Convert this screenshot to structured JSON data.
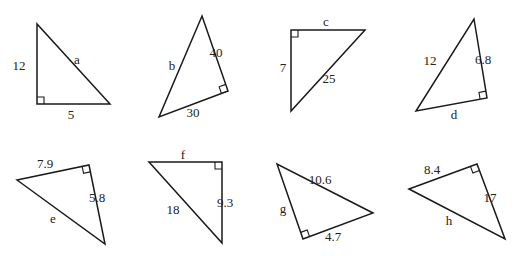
{
  "diagram": {
    "type": "right-triangle-set",
    "triangles": [
      {
        "id": "a",
        "unknown": "a",
        "known": [
          {
            "side": "leg",
            "value": "12"
          },
          {
            "side": "leg",
            "value": "5"
          }
        ],
        "unknown_side": "hypotenuse",
        "pts": [
          [
            37,
            24
          ],
          [
            37,
            104
          ],
          [
            110,
            104
          ]
        ],
        "right_angle": 1,
        "labels": [
          {
            "text": "12",
            "x": 19,
            "y": 70
          },
          {
            "text": "a",
            "x": 77,
            "y": 64
          },
          {
            "text": "5",
            "x": 71,
            "y": 119
          }
        ]
      },
      {
        "id": "b",
        "unknown": "b",
        "known": [
          {
            "side": "leg",
            "value": "40"
          },
          {
            "side": "leg",
            "value": "30"
          }
        ],
        "unknown_side": "hypotenuse",
        "pts": [
          [
            202,
            16
          ],
          [
            228,
            91
          ],
          [
            159,
            117
          ]
        ],
        "right_angle": 1,
        "labels": [
          {
            "text": "b",
            "x": 172,
            "y": 70
          },
          {
            "text": "40",
            "x": 216,
            "y": 57
          },
          {
            "text": "30",
            "x": 193,
            "y": 117
          }
        ]
      },
      {
        "id": "c",
        "unknown": "c",
        "known": [
          {
            "side": "leg",
            "value": "7"
          },
          {
            "side": "hypotenuse",
            "value": "25"
          }
        ],
        "unknown_side": "leg",
        "pts": [
          [
            365,
            30
          ],
          [
            291,
            30
          ],
          [
            291,
            111
          ]
        ],
        "right_angle": 1,
        "labels": [
          {
            "text": "c",
            "x": 326,
            "y": 26
          },
          {
            "text": "7",
            "x": 283,
            "y": 72
          },
          {
            "text": "25",
            "x": 329,
            "y": 83
          }
        ]
      },
      {
        "id": "d",
        "unknown": "d",
        "known": [
          {
            "side": "hypotenuse",
            "value": "12"
          },
          {
            "side": "leg",
            "value": "6.8"
          }
        ],
        "unknown_side": "leg",
        "pts": [
          [
            474,
            19
          ],
          [
            487,
            98
          ],
          [
            416,
            111
          ]
        ],
        "right_angle": 1,
        "labels": [
          {
            "text": "12",
            "x": 430,
            "y": 65
          },
          {
            "text": "6.8",
            "x": 483,
            "y": 64
          },
          {
            "text": "d",
            "x": 454,
            "y": 119
          }
        ]
      },
      {
        "id": "e",
        "unknown": "e",
        "known": [
          {
            "side": "leg",
            "value": "7.9"
          },
          {
            "side": "leg",
            "value": "5.8"
          }
        ],
        "unknown_side": "hypotenuse",
        "pts": [
          [
            17,
            180
          ],
          [
            89,
            165
          ],
          [
            105,
            244
          ]
        ],
        "right_angle": 1,
        "labels": [
          {
            "text": "7.9",
            "x": 45,
            "y": 168
          },
          {
            "text": "5.8",
            "x": 97,
            "y": 202
          },
          {
            "text": "e",
            "x": 53,
            "y": 223
          }
        ]
      },
      {
        "id": "f",
        "unknown": "f",
        "known": [
          {
            "side": "hypotenuse",
            "value": "18"
          },
          {
            "side": "leg",
            "value": "9.3"
          }
        ],
        "unknown_side": "leg",
        "pts": [
          [
            149,
            162
          ],
          [
            222,
            162
          ],
          [
            222,
            243
          ]
        ],
        "right_angle": 1,
        "labels": [
          {
            "text": "f",
            "x": 183,
            "y": 159
          },
          {
            "text": "18",
            "x": 173,
            "y": 214
          },
          {
            "text": "9.3",
            "x": 225,
            "y": 207
          }
        ]
      },
      {
        "id": "g",
        "unknown": "g",
        "known": [
          {
            "side": "hypotenuse",
            "value": "10.6"
          },
          {
            "side": "leg",
            "value": "4.7"
          }
        ],
        "unknown_side": "leg",
        "pts": [
          [
            277,
            164
          ],
          [
            303,
            239
          ],
          [
            373,
            213
          ]
        ],
        "right_angle": 1,
        "labels": [
          {
            "text": "10.6",
            "x": 320,
            "y": 184
          },
          {
            "text": "g",
            "x": 283,
            "y": 213
          },
          {
            "text": "4.7",
            "x": 333,
            "y": 241
          }
        ]
      },
      {
        "id": "h",
        "unknown": "h",
        "known": [
          {
            "side": "leg",
            "value": "8.4"
          },
          {
            "side": "leg",
            "value": "17"
          }
        ],
        "unknown_side": "hypotenuse",
        "pts": [
          [
            409,
            189
          ],
          [
            477,
            164
          ],
          [
            505,
            239
          ]
        ],
        "right_angle": 1,
        "labels": [
          {
            "text": "8.4",
            "x": 432,
            "y": 174
          },
          {
            "text": "17",
            "x": 490,
            "y": 202
          },
          {
            "text": "h",
            "x": 449,
            "y": 225
          }
        ]
      }
    ]
  },
  "style": {
    "line_color": "#1a1a1a",
    "text_color": "#222222",
    "background": "#ffffff"
  }
}
